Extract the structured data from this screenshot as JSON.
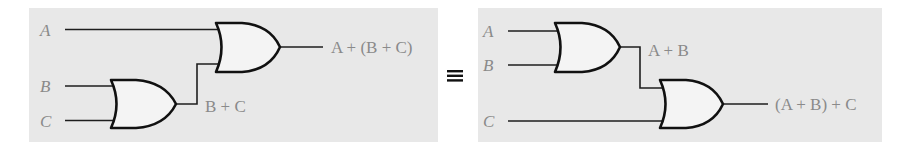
{
  "figure": {
    "equivalence_symbol": "≡",
    "colors": {
      "panel": "#e8e8e8",
      "gate_fill": "#f4f4f4",
      "stroke": "#111111",
      "label": "#8a8a8a"
    }
  },
  "left_circuit": {
    "inputs": [
      "A",
      "B",
      "C"
    ],
    "gates": [
      {
        "type": "OR",
        "inputs": [
          "B",
          "C"
        ],
        "output_label": "B + C"
      },
      {
        "type": "OR",
        "inputs": [
          "A",
          "B + C"
        ],
        "output_label": "A + (B + C)"
      }
    ],
    "labels": {
      "a": "A",
      "b": "B",
      "c": "C",
      "intermediate": "B + C",
      "output": "A + (B + C)"
    }
  },
  "right_circuit": {
    "inputs": [
      "A",
      "B",
      "C"
    ],
    "gates": [
      {
        "type": "OR",
        "inputs": [
          "A",
          "B"
        ],
        "output_label": "A + B"
      },
      {
        "type": "OR",
        "inputs": [
          "A + B",
          "C"
        ],
        "output_label": "(A + B) + C"
      }
    ],
    "labels": {
      "a": "A",
      "b": "B",
      "c": "C",
      "intermediate": "A + B",
      "output": "(A + B) + C"
    }
  }
}
